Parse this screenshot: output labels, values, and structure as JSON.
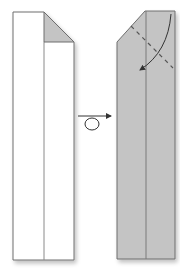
{
  "diagram": {
    "colors": {
      "paper_front": "#ffffff",
      "paper_back": "#c4c4c4",
      "outline": "#6e6e6e",
      "crease": "#888888",
      "arrow": "#333333"
    },
    "steps": [
      {
        "name": "step-left",
        "description": "Long strip with top-right corner folded down (shaded flap)"
      },
      {
        "name": "step-right",
        "description": "Strip turned over, shaded side up, with dashed valley-fold line and curved fold arrow at top"
      }
    ],
    "turn_over_symbol": "turn-over-arrow"
  }
}
